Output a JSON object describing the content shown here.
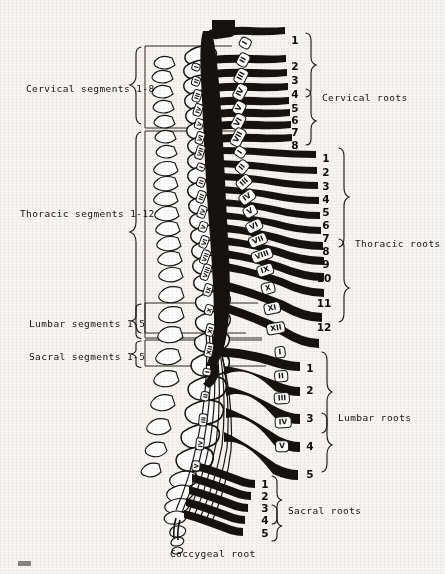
{
  "figure": {
    "background_color": "#f7f6f3",
    "ink_color": "#16130f"
  },
  "segment_labels": [
    {
      "id": "cervical-segments",
      "text": "Cervical segments 1-8",
      "x": 26,
      "y": 83,
      "brace_top": 46,
      "brace_bottom": 128
    },
    {
      "id": "thoracic-segments",
      "text": "Thoracic segments 1-12",
      "x": 20,
      "y": 208,
      "brace_top": 131,
      "brace_bottom": 333
    },
    {
      "id": "lumbar-segments",
      "text": "Lumbar segments 1-5",
      "x": 29,
      "y": 318,
      "brace_top": 303,
      "brace_bottom": 338
    },
    {
      "id": "sacral-segments",
      "text": "Sacral segments 1-5",
      "x": 29,
      "y": 351,
      "brace_top": 340,
      "brace_bottom": 366
    }
  ],
  "root_groups": [
    {
      "id": "cervical-roots",
      "label": "Cervical roots",
      "label_x": 322,
      "label_y": 92,
      "brace_x": 306,
      "brace_top": 33,
      "brace_bottom": 145,
      "numbers": [
        "1",
        "2",
        "3",
        "4",
        "5",
        "6",
        "7",
        "8"
      ],
      "number_x": 288,
      "number_ys": [
        34,
        60,
        74,
        88,
        102,
        114,
        126,
        139
      ]
    },
    {
      "id": "thoracic-roots",
      "label": "Thoracic roots",
      "label_x": 355,
      "label_y": 238,
      "brace_x": 339,
      "brace_top": 148,
      "brace_bottom": 330,
      "numbers": [
        "1",
        "2",
        "3",
        "4",
        "5",
        "6",
        "7",
        "8",
        "9",
        "10",
        "11",
        "12"
      ],
      "number_x": 319,
      "number_ys": [
        152,
        166,
        180,
        193,
        206,
        219,
        232,
        245,
        258,
        272,
        297,
        321
      ]
    },
    {
      "id": "lumbar-roots",
      "label": "Lumbar roots",
      "label_x": 338,
      "label_y": 412,
      "brace_x": 322,
      "brace_top": 352,
      "brace_bottom": 472,
      "numbers": [
        "1",
        "2",
        "3",
        "4",
        "5"
      ],
      "number_x": 303,
      "number_ys": [
        362,
        384,
        412,
        440,
        468
      ]
    },
    {
      "id": "sacral-roots",
      "label": "Sacral roots",
      "label_x": 288,
      "label_y": 505,
      "brace_x": 272,
      "brace_top": 476,
      "brace_bottom": 534,
      "numbers": [
        "1",
        "2",
        "3",
        "4",
        "5"
      ],
      "number_x": 258,
      "number_ys": [
        478,
        490,
        502,
        514,
        527
      ]
    }
  ],
  "coccygeal": {
    "label": "Coccygeal root",
    "x": 170,
    "y": 548
  },
  "vertebrae": {
    "cervical": [
      "I",
      "II",
      "III",
      "IV",
      "V",
      "VI",
      "VII"
    ],
    "thoracic": [
      "I",
      "II",
      "III",
      "IV",
      "V",
      "VI",
      "VII",
      "VIII",
      "IX",
      "X",
      "XI",
      "XII"
    ],
    "lumbar": [
      "I",
      "II",
      "III",
      "IV",
      "V"
    ],
    "sacral": [
      "I",
      "II",
      "III",
      "IV",
      "V"
    ]
  },
  "cord_vertebra_tags": [
    {
      "text": "I",
      "x": 245,
      "y": 43,
      "rot": -62
    },
    {
      "text": "II",
      "x": 243,
      "y": 60,
      "rot": -62
    },
    {
      "text": "III",
      "x": 241,
      "y": 76,
      "rot": -62
    },
    {
      "text": "IV",
      "x": 240,
      "y": 92,
      "rot": -62
    },
    {
      "text": "V",
      "x": 239,
      "y": 108,
      "rot": -62
    },
    {
      "text": "VI",
      "x": 238,
      "y": 122,
      "rot": -62
    },
    {
      "text": "VII",
      "x": 238,
      "y": 137,
      "rot": -62
    },
    {
      "text": "I",
      "x": 240,
      "y": 152,
      "rot": -55
    },
    {
      "text": "II",
      "x": 242,
      "y": 167,
      "rot": -50
    },
    {
      "text": "III",
      "x": 244,
      "y": 182,
      "rot": -42
    },
    {
      "text": "IV",
      "x": 247,
      "y": 197,
      "rot": -36
    },
    {
      "text": "V",
      "x": 250,
      "y": 211,
      "rot": -30
    },
    {
      "text": "VI",
      "x": 254,
      "y": 226,
      "rot": -26
    },
    {
      "text": "VII",
      "x": 258,
      "y": 240,
      "rot": -22
    },
    {
      "text": "VIII",
      "x": 262,
      "y": 255,
      "rot": -20
    },
    {
      "text": "IX",
      "x": 265,
      "y": 270,
      "rot": -18
    },
    {
      "text": "X",
      "x": 268,
      "y": 288,
      "rot": -14
    },
    {
      "text": "XI",
      "x": 272,
      "y": 308,
      "rot": -12
    },
    {
      "text": "XII",
      "x": 276,
      "y": 328,
      "rot": -10
    },
    {
      "text": "I",
      "x": 280,
      "y": 352,
      "rot": -6
    },
    {
      "text": "II",
      "x": 281,
      "y": 376,
      "rot": -4
    },
    {
      "text": "III",
      "x": 282,
      "y": 398,
      "rot": -3
    },
    {
      "text": "IV",
      "x": 283,
      "y": 422,
      "rot": -2
    },
    {
      "text": "V",
      "x": 282,
      "y": 446,
      "rot": -2
    }
  ],
  "column_vertebra_tags": [
    {
      "text": "I",
      "x": 196,
      "y": 67,
      "rot": -72
    },
    {
      "text": "II",
      "x": 196,
      "y": 81,
      "rot": -72
    },
    {
      "text": "III",
      "x": 197,
      "y": 96,
      "rot": -72
    },
    {
      "text": "IV",
      "x": 198,
      "y": 110,
      "rot": -72
    },
    {
      "text": "V",
      "x": 199,
      "y": 124,
      "rot": -72
    },
    {
      "text": "VI",
      "x": 200,
      "y": 138,
      "rot": -72
    },
    {
      "text": "VII",
      "x": 200,
      "y": 152,
      "rot": -72
    },
    {
      "text": "I",
      "x": 201,
      "y": 167,
      "rot": -70
    },
    {
      "text": "II",
      "x": 201,
      "y": 182,
      "rot": -70
    },
    {
      "text": "III",
      "x": 201,
      "y": 197,
      "rot": -70
    },
    {
      "text": "IV",
      "x": 202,
      "y": 212,
      "rot": -70
    },
    {
      "text": "V",
      "x": 203,
      "y": 227,
      "rot": -70
    },
    {
      "text": "VI",
      "x": 204,
      "y": 242,
      "rot": -70
    },
    {
      "text": "VII",
      "x": 205,
      "y": 257,
      "rot": -70
    },
    {
      "text": "VIII",
      "x": 206,
      "y": 272,
      "rot": -70
    },
    {
      "text": "IX",
      "x": 208,
      "y": 290,
      "rot": -72
    },
    {
      "text": "X",
      "x": 209,
      "y": 310,
      "rot": -74
    },
    {
      "text": "XI",
      "x": 210,
      "y": 330,
      "rot": -76
    },
    {
      "text": "XII",
      "x": 209,
      "y": 350,
      "rot": -78
    },
    {
      "text": "I",
      "x": 207,
      "y": 372,
      "rot": -80
    },
    {
      "text": "II",
      "x": 205,
      "y": 396,
      "rot": -82
    },
    {
      "text": "III",
      "x": 203,
      "y": 420,
      "rot": -84
    },
    {
      "text": "IV",
      "x": 200,
      "y": 444,
      "rot": -84
    },
    {
      "text": "V",
      "x": 196,
      "y": 466,
      "rot": -86
    }
  ]
}
